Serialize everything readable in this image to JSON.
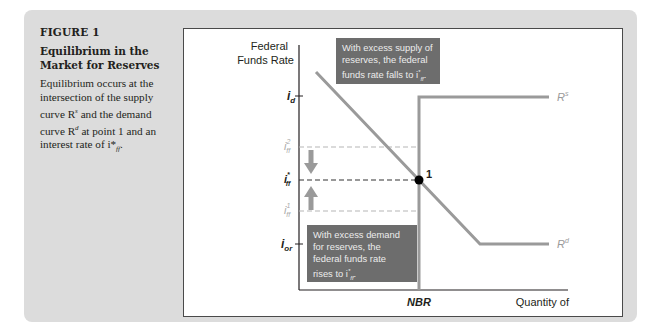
{
  "figure": {
    "number": "FIGURE 1",
    "title": "Equilibrium in the Market for Reserves",
    "description": {
      "part1": "Equilibrium occurs at the intersection of the supply curve R",
      "sup_s": "s",
      "part2": " and the demand curve R",
      "sup_d": "d",
      "part3": " at point 1 and an interest rate of i*",
      "sub_ff": "ff",
      "part4": "."
    }
  },
  "chart": {
    "y_axis_title_line1": "Federal",
    "y_axis_title_line2": "Funds Rate",
    "x_axis_label_nbr": "NBR",
    "x_axis_title": "Quantity of",
    "tick_labels": {
      "i_d": "i",
      "i_d_sub": "d",
      "i_ff2": "i",
      "i_ff2_sup": "2",
      "i_ff2_sub": "ff",
      "i_ffstar": "i",
      "i_ffstar_sup": "*",
      "i_ffstar_sub": "ff",
      "i_ff1": "i",
      "i_ff1_sup": "1",
      "i_ff1_sub": "ff",
      "i_or": "i",
      "i_or_sub": "or"
    },
    "supply_label": "R",
    "supply_label_sup": "s",
    "demand_label": "R",
    "demand_label_sup": "d",
    "point_label": "1",
    "note_top": {
      "line1": "With excess supply of",
      "line2": "reserves, the federal",
      "line3": "funds rate falls to i",
      "line3_sub": "ff",
      "line3_sup": "*",
      "line3_end": "."
    },
    "note_bottom": {
      "line1": "With excess demand",
      "line2": "for reserves, the",
      "line3": "federal funds rate",
      "line4": "rises to i",
      "line4_sub": "ff",
      "line4_sup": "*",
      "line4_end": "."
    },
    "colors": {
      "curve": "#9a9a9a",
      "axis": "#231f20",
      "note_bg": "#6d6d6d",
      "dashed_light": "#b5b5b5",
      "dashed_dark": "#333333"
    }
  }
}
